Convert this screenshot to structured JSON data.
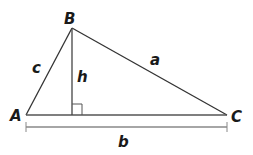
{
  "diagram": {
    "type": "triangle-with-altitude",
    "colors": {
      "edge": "#333333",
      "altitude": "#444444",
      "measure": "#888888",
      "label": "#1a1a1a"
    },
    "vertices": {
      "A": {
        "label": "A",
        "x": 26,
        "y": 115
      },
      "B": {
        "label": "B",
        "x": 72,
        "y": 28
      },
      "C": {
        "label": "C",
        "x": 227,
        "y": 115
      }
    },
    "sides": {
      "a": {
        "label": "a",
        "from": "B",
        "to": "C"
      },
      "b": {
        "label": "b",
        "from": "A",
        "to": "C"
      },
      "c": {
        "label": "c",
        "from": "A",
        "to": "B"
      }
    },
    "altitude": {
      "label": "h",
      "from": "B",
      "foot_x": 72,
      "foot_y": 115
    },
    "right_angle_marker": {
      "x": 72,
      "y": 104,
      "size": 11
    },
    "base_measure": {
      "label": "b",
      "y": 127,
      "x1": 26,
      "x2": 227
    }
  }
}
